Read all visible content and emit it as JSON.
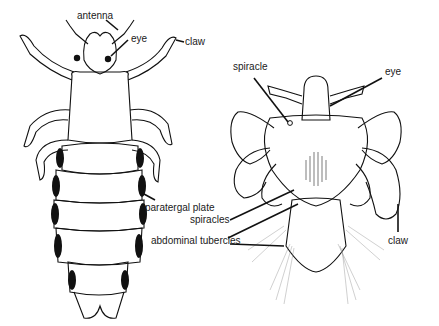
{
  "figure": {
    "left_specimen": {
      "name": "body louse (dorsal view)",
      "labels": {
        "antenna": "antenna",
        "eye": "eye",
        "claw": "claw",
        "paratergal_plate": "paratergal plate"
      }
    },
    "right_specimen": {
      "name": "crab louse (dorsal view)",
      "labels": {
        "spiracle": "spiracle",
        "eye": "eye",
        "spiracles": "spiracles",
        "abdominal_tubercles": "abdominal tubercles",
        "claw": "claw"
      }
    }
  }
}
